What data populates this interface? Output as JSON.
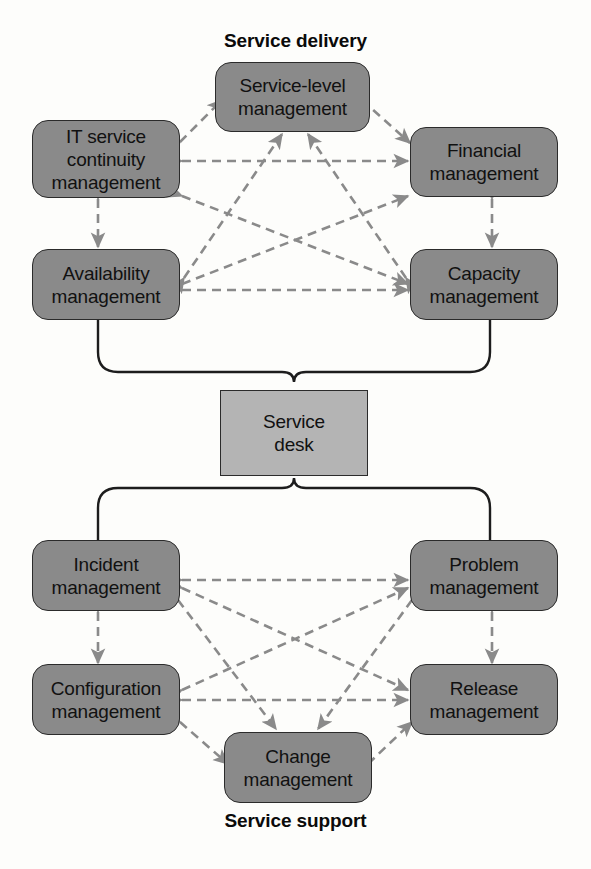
{
  "diagram": {
    "title_top": "Service delivery",
    "title_bottom": "Service support",
    "box_fill": "#8a8a8a",
    "hub_fill": "#b4b4b4",
    "box_stroke": "#2b2b2b",
    "connector_color": "#8a8a8a",
    "brace_color": "#1d1d1d"
  },
  "service_delivery": {
    "label": "Service delivery",
    "nodes": [
      {
        "id": "slm",
        "line1": "Service-level",
        "line2": "management",
        "line3": ""
      },
      {
        "id": "itscm",
        "line1": "IT service",
        "line2": "continuity",
        "line3": "management"
      },
      {
        "id": "financial",
        "line1": "Financial",
        "line2": "management",
        "line3": ""
      },
      {
        "id": "availability",
        "line1": "Availability",
        "line2": "management",
        "line3": ""
      },
      {
        "id": "capacity",
        "line1": "Capacity",
        "line2": "management",
        "line3": ""
      }
    ]
  },
  "service_desk": {
    "line1": "Service",
    "line2": "desk"
  },
  "service_support": {
    "label": "Service support",
    "nodes": [
      {
        "id": "incident",
        "line1": "Incident",
        "line2": "management",
        "line3": ""
      },
      {
        "id": "problem",
        "line1": "Problem",
        "line2": "management",
        "line3": ""
      },
      {
        "id": "configuration",
        "line1": "Configuration",
        "line2": "management",
        "line3": ""
      },
      {
        "id": "release",
        "line1": "Release",
        "line2": "management",
        "line3": ""
      },
      {
        "id": "change",
        "line1": "Change",
        "line2": "management",
        "line3": ""
      }
    ]
  }
}
